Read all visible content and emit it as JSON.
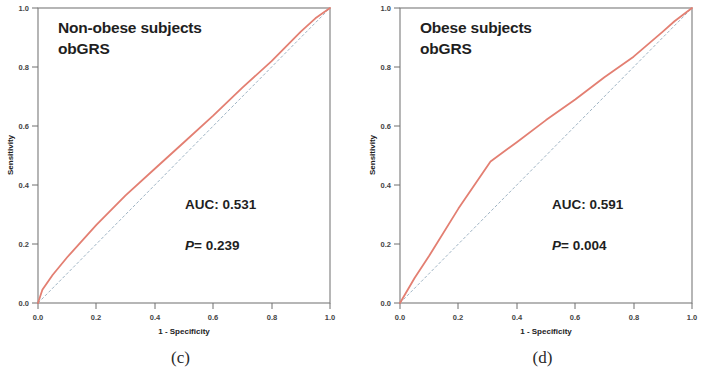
{
  "figure": {
    "panels": [
      {
        "caption": "(c)",
        "title_line1": "Non-obese subjects",
        "title_line2": "obGRS",
        "auc_label": "AUC: 0.531",
        "p_italic": "P",
        "p_value": "= 0.239"
      },
      {
        "caption": "(d)",
        "title_line1": "Obese subjects",
        "title_line2": "obGRS",
        "auc_label": "AUC: 0.591",
        "p_italic": "P",
        "p_value": "= 0.004"
      }
    ]
  },
  "chart_data": [
    {
      "type": "line",
      "title": "Non-obese subjects obGRS",
      "subtitle": "obGRS",
      "caption": "(c)",
      "xlabel": "1 - Specificity",
      "ylabel": "Sensitivity",
      "xlim": [
        0.0,
        1.0
      ],
      "ylim": [
        0.0,
        1.0
      ],
      "xticks": [
        "0.0",
        "0.2",
        "0.4",
        "0.6",
        "0.8",
        "1.0"
      ],
      "yticks": [
        "0.0",
        "0.2",
        "0.4",
        "0.6",
        "0.8",
        "1.0"
      ],
      "xtick_values": [
        0.0,
        0.2,
        0.4,
        0.6,
        0.8,
        1.0
      ],
      "ytick_values": [
        0.0,
        0.2,
        0.4,
        0.6,
        0.8,
        1.0
      ],
      "grid": false,
      "legend": "none",
      "annotations": [
        "AUC: 0.531",
        "P= 0.239"
      ],
      "auc": 0.531,
      "p_value": 0.239,
      "series": [
        {
          "name": "ROC curve",
          "color": "#e37f72",
          "style": "solid",
          "x": [
            0.0,
            0.015,
            0.05,
            0.1,
            0.2,
            0.3,
            0.4,
            0.5,
            0.6,
            0.7,
            0.8,
            0.9,
            0.95,
            1.0
          ],
          "y": [
            0.0,
            0.045,
            0.095,
            0.155,
            0.265,
            0.365,
            0.455,
            0.545,
            0.635,
            0.73,
            0.82,
            0.92,
            0.965,
            1.0
          ]
        },
        {
          "name": "Reference line",
          "color": "#9fb4c4",
          "style": "dashed",
          "x": [
            0.0,
            1.0
          ],
          "y": [
            0.0,
            1.0
          ]
        }
      ]
    },
    {
      "type": "line",
      "title": "Obese subjects obGRS",
      "subtitle": "obGRS",
      "caption": "(d)",
      "xlabel": "1 - Specificity",
      "ylabel": "Sensitivity",
      "xlim": [
        0.0,
        1.0
      ],
      "ylim": [
        0.0,
        1.0
      ],
      "xticks": [
        "0.0",
        "0.2",
        "0.4",
        "0.6",
        "0.8",
        "1.0"
      ],
      "yticks": [
        "0.0",
        "0.2",
        "0.4",
        "0.6",
        "0.8",
        "1.0"
      ],
      "xtick_values": [
        0.0,
        0.2,
        0.4,
        0.6,
        0.8,
        1.0
      ],
      "ytick_values": [
        0.0,
        0.2,
        0.4,
        0.6,
        0.8,
        1.0
      ],
      "grid": false,
      "legend": "none",
      "annotations": [
        "AUC: 0.591",
        "P= 0.004"
      ],
      "auc": 0.591,
      "p_value": 0.004,
      "series": [
        {
          "name": "ROC curve",
          "color": "#e37f72",
          "style": "solid",
          "x": [
            0.0,
            0.05,
            0.1,
            0.2,
            0.31,
            0.4,
            0.5,
            0.6,
            0.7,
            0.8,
            0.9,
            0.94,
            1.0
          ],
          "y": [
            0.0,
            0.085,
            0.16,
            0.32,
            0.48,
            0.545,
            0.62,
            0.69,
            0.765,
            0.835,
            0.92,
            0.955,
            1.0
          ]
        },
        {
          "name": "Reference line",
          "color": "#9fb4c4",
          "style": "dashed",
          "x": [
            0.0,
            1.0
          ],
          "y": [
            0.0,
            1.0
          ]
        }
      ]
    }
  ]
}
